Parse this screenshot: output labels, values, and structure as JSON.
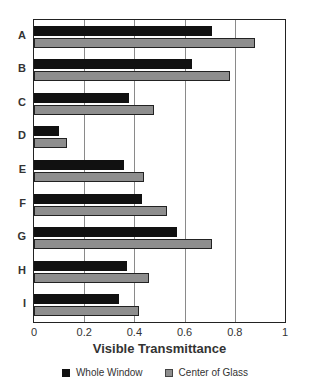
{
  "chart_data": {
    "type": "bar",
    "orientation": "horizontal",
    "title": "",
    "xlabel": "Visible Transmittance",
    "ylabel": "",
    "xlim": [
      0,
      1
    ],
    "x_ticks": [
      "0",
      "0.2",
      "0.4",
      "0.6",
      "0.8",
      "1"
    ],
    "grid": true,
    "legend_position": "bottom",
    "categories": [
      "A",
      "B",
      "C",
      "D",
      "E",
      "F",
      "G",
      "H",
      "I"
    ],
    "series": [
      {
        "name": "Whole Window",
        "color": "#111111",
        "values": [
          0.71,
          0.63,
          0.38,
          0.1,
          0.36,
          0.43,
          0.57,
          0.37,
          0.34
        ]
      },
      {
        "name": "Center of Glass",
        "color": "#8e8e8e",
        "values": [
          0.88,
          0.78,
          0.48,
          0.13,
          0.44,
          0.53,
          0.71,
          0.46,
          0.42
        ]
      }
    ]
  }
}
